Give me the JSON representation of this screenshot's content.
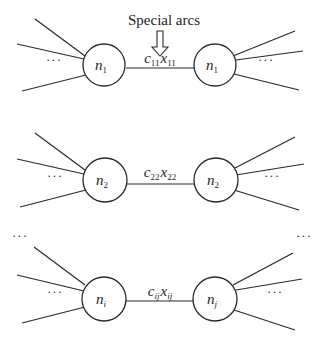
{
  "annotation": {
    "label": "Special arcs",
    "arrow": "hollow-down-arrow"
  },
  "rows": [
    {
      "left_node": {
        "base": "n",
        "sub": "1"
      },
      "right_node": {
        "base": "n",
        "sub": "1"
      },
      "arc_label": {
        "c": "c",
        "c_sub": "11",
        "x": "x",
        "x_sub": "11"
      }
    },
    {
      "left_node": {
        "base": "n",
        "sub": "2"
      },
      "right_node": {
        "base": "n",
        "sub": "2"
      },
      "arc_label": {
        "c": "c",
        "c_sub": "22",
        "x": "x",
        "x_sub": "22"
      }
    },
    {
      "left_node": {
        "base": "n",
        "sub": "i"
      },
      "right_node": {
        "base": "n",
        "sub": "j"
      },
      "arc_label": {
        "c": "c",
        "c_sub": "ij",
        "x": "x",
        "x_sub": "ij"
      }
    }
  ],
  "ellipsis": "···",
  "colors": {
    "stroke": "#2a2a2a",
    "background": "#ffffff"
  }
}
